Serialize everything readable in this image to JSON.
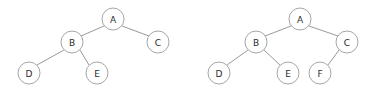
{
  "figure": {
    "background_color": "#ffffff",
    "width": 381,
    "height": 95,
    "node_radius": 11,
    "node_fill": "#ffffff",
    "node_stroke": "#a6a6a6",
    "edge_stroke": "#9a9a9a",
    "label_color": "#2b2b2b"
  },
  "chart_data": {
    "type": "diagram",
    "diagram_kind": "binary-tree-pair",
    "title": "",
    "xlabel": "",
    "ylabel": "",
    "grid": false,
    "legend": null,
    "trees": [
      {
        "name": "left-tree",
        "root": "A",
        "node_count": 5,
        "nodes": [
          {
            "id": "left-A",
            "label": "A",
            "cx": 113,
            "cy": 19,
            "r": 11,
            "depth": 0
          },
          {
            "id": "left-B",
            "label": "B",
            "cx": 72,
            "cy": 42,
            "r": 11,
            "depth": 1
          },
          {
            "id": "left-C",
            "label": "C",
            "cx": 158,
            "cy": 42,
            "r": 11,
            "depth": 1
          },
          {
            "id": "left-D",
            "label": "D",
            "cx": 29,
            "cy": 73,
            "r": 11,
            "depth": 2
          },
          {
            "id": "left-E",
            "label": "E",
            "cx": 97,
            "cy": 73,
            "r": 11,
            "depth": 2
          }
        ],
        "edges": [
          {
            "id": "left-edge-A-B",
            "from": "A",
            "to": "B",
            "x1": 104,
            "y1": 26,
            "x2": 81,
            "y2": 36
          },
          {
            "id": "left-edge-A-C",
            "from": "A",
            "to": "C",
            "x1": 122,
            "y1": 26,
            "x2": 149,
            "y2": 36
          },
          {
            "id": "left-edge-B-D",
            "from": "B",
            "to": "D",
            "x1": 64,
            "y1": 50,
            "x2": 37,
            "y2": 65
          },
          {
            "id": "left-edge-B-E",
            "from": "B",
            "to": "E",
            "x1": 80,
            "y1": 50,
            "x2": 89,
            "y2": 65
          }
        ]
      },
      {
        "name": "right-tree",
        "root": "A",
        "node_count": 6,
        "nodes": [
          {
            "id": "right-A",
            "label": "A",
            "cx": 300,
            "cy": 19,
            "r": 11,
            "depth": 0
          },
          {
            "id": "right-B",
            "label": "B",
            "cx": 256,
            "cy": 42,
            "r": 11,
            "depth": 1
          },
          {
            "id": "right-C",
            "label": "C",
            "cx": 347,
            "cy": 42,
            "r": 11,
            "depth": 1
          },
          {
            "id": "right-D",
            "label": "D",
            "cx": 219,
            "cy": 73,
            "r": 11,
            "depth": 2
          },
          {
            "id": "right-E",
            "label": "E",
            "cx": 288,
            "cy": 73,
            "r": 11,
            "depth": 2
          },
          {
            "id": "right-F",
            "label": "F",
            "cx": 320,
            "cy": 73,
            "r": 11,
            "depth": 2
          }
        ],
        "edges": [
          {
            "id": "right-edge-A-B",
            "from": "A",
            "to": "B",
            "x1": 291,
            "y1": 26,
            "x2": 265,
            "y2": 36
          },
          {
            "id": "right-edge-A-C",
            "from": "A",
            "to": "C",
            "x1": 309,
            "y1": 26,
            "x2": 338,
            "y2": 36
          },
          {
            "id": "right-edge-B-D",
            "from": "B",
            "to": "D",
            "x1": 248,
            "y1": 50,
            "x2": 227,
            "y2": 65
          },
          {
            "id": "right-edge-B-E",
            "from": "B",
            "to": "E",
            "x1": 264,
            "y1": 50,
            "x2": 280,
            "y2": 65
          },
          {
            "id": "right-edge-C-F",
            "from": "C",
            "to": "F",
            "x1": 339,
            "y1": 50,
            "x2": 328,
            "y2": 65
          }
        ]
      }
    ]
  }
}
